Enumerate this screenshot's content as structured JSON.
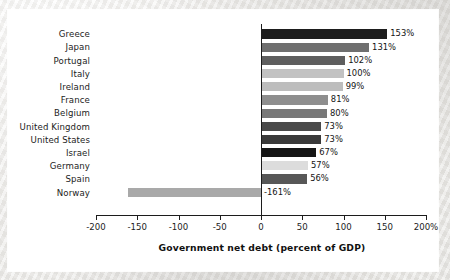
{
  "chart_data": {
    "type": "bar",
    "orientation": "horizontal",
    "title": "",
    "subtitle": "",
    "xlabel": "Government net debt (percent of GDP)",
    "ylabel": "",
    "xlim": [
      -200,
      200
    ],
    "xticks": [
      -200,
      -150,
      -100,
      -50,
      0,
      50,
      100,
      150,
      200
    ],
    "xtick_labels": [
      "-200",
      "-150",
      "-100",
      "-50",
      "0",
      "50",
      "100",
      "150",
      "200%"
    ],
    "grid": false,
    "legend": false,
    "legend_position": "none",
    "zero_line": true,
    "categories": [
      "Greece",
      "Japan",
      "Portugal",
      "Italy",
      "Ireland",
      "France",
      "Belgium",
      "United Kingdom",
      "United States",
      "Israel",
      "Germany",
      "Spain",
      "Norway"
    ],
    "values": [
      153,
      131,
      102,
      100,
      99,
      81,
      80,
      73,
      73,
      67,
      57,
      56,
      -161
    ],
    "data_labels": [
      "153%",
      "131%",
      "102%",
      "100%",
      "99%",
      "81%",
      "80%",
      "73%",
      "73%",
      "67%",
      "57%",
      "56%",
      "-161%"
    ],
    "bar_colors": [
      "#1d1d1d",
      "#6f6f6f",
      "#5e5e5e",
      "#c2c2c2",
      "#bdbdbd",
      "#8e8e8e",
      "#787878",
      "#4a4a4a",
      "#3a3a3a",
      "#151515",
      "#dcdcdc",
      "#575757",
      "#a9a9a9"
    ]
  },
  "axis_title": "Government net debt (percent of GDP)"
}
